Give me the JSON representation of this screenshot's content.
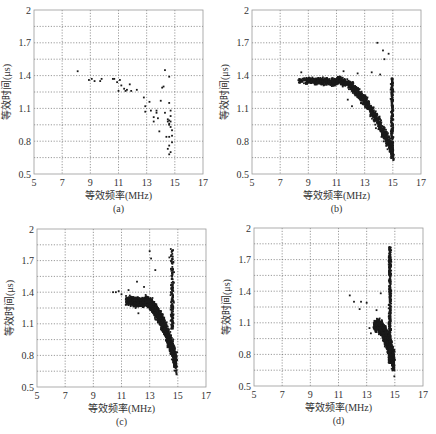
{
  "figure": {
    "panel_count": 4,
    "point_color": "#1a1a1a",
    "grid_color": "#555555",
    "frame_color": "#9a9a9a"
  },
  "axes": {
    "xlabel": "等效频率(MHz)",
    "ylabel": "等效时间(μs)",
    "xticks": [
      "5",
      "7",
      "9",
      "11",
      "13",
      "15",
      "17"
    ],
    "yticks": [
      "0.5",
      "0.8",
      "1.1",
      "1.4",
      "1.7",
      "2"
    ],
    "xlim": [
      5,
      17
    ],
    "ylim": [
      0.5,
      2.0
    ],
    "x_grid": [
      5,
      7,
      9,
      11,
      13,
      15,
      17
    ],
    "y_grid": [
      0.5,
      0.65,
      0.8,
      0.95,
      1.1,
      1.25,
      1.4,
      1.55,
      1.7,
      1.85,
      2.0
    ]
  },
  "chart_data": [
    {
      "type": "scatter",
      "panel": "(a)",
      "title": "",
      "xlabel": "等效频率(MHz)",
      "ylabel": "等效时间(μs)",
      "xlim": [
        5,
        17
      ],
      "ylim": [
        0.5,
        2.0
      ],
      "grid": true,
      "legend": null,
      "box": {
        "left": 34,
        "top": 10,
        "right": 203,
        "bottom": 174
      },
      "points": [
        [
          8.1,
          1.44
        ],
        [
          8.9,
          1.36
        ],
        [
          9.1,
          1.37
        ],
        [
          9.3,
          1.35
        ],
        [
          9.7,
          1.35
        ],
        [
          9.8,
          1.37
        ],
        [
          10.6,
          1.37
        ],
        [
          10.7,
          1.37
        ],
        [
          10.9,
          1.34
        ],
        [
          11.0,
          1.26
        ],
        [
          11.1,
          1.36
        ],
        [
          11.2,
          1.31
        ],
        [
          11.4,
          1.28
        ],
        [
          11.5,
          1.26
        ],
        [
          11.6,
          1.27
        ],
        [
          11.8,
          1.32
        ],
        [
          11.9,
          1.26
        ],
        [
          12.3,
          1.27
        ],
        [
          12.8,
          1.2
        ],
        [
          12.9,
          1.12
        ],
        [
          12.9,
          1.07
        ],
        [
          13.2,
          1.16
        ],
        [
          13.3,
          1.08
        ],
        [
          13.5,
          1.02
        ],
        [
          13.5,
          0.98
        ],
        [
          13.7,
          1.08
        ],
        [
          13.7,
          1.06
        ],
        [
          13.8,
          1.01
        ],
        [
          13.9,
          0.89
        ],
        [
          14.0,
          1.17
        ],
        [
          14.1,
          1.29
        ],
        [
          14.2,
          1.3
        ],
        [
          14.3,
          1.45
        ],
        [
          14.3,
          1.06
        ],
        [
          14.4,
          0.84
        ],
        [
          14.5,
          0.98
        ],
        [
          14.5,
          0.73
        ],
        [
          14.6,
          1.39
        ],
        [
          14.6,
          1.15
        ],
        [
          14.6,
          0.99
        ],
        [
          14.6,
          0.96
        ],
        [
          14.7,
          1.08
        ],
        [
          14.7,
          1.03
        ],
        [
          14.7,
          0.93
        ],
        [
          14.6,
          0.84
        ],
        [
          14.6,
          0.76
        ],
        [
          14.7,
          0.7
        ],
        [
          14.8,
          0.9
        ],
        [
          14.8,
          0.79
        ],
        [
          14.6,
          0.68
        ],
        [
          14.5,
          1.0
        ],
        [
          14.7,
          0.98
        ],
        [
          14.6,
          0.95
        ],
        [
          14.8,
          0.85
        ]
      ]
    },
    {
      "type": "scatter",
      "panel": "(b)",
      "title": "",
      "xlabel": "等效频率(MHz)",
      "ylabel": "等效时间(μs)",
      "xlim": [
        5,
        17
      ],
      "ylim": [
        0.5,
        2.0
      ],
      "grid": true,
      "legend": null,
      "box": {
        "left": 252,
        "top": 10,
        "right": 421,
        "bottom": 174
      },
      "description": "Dense cloud (~1500 pts): plateau at ~1.35 µs from 8.3–11.5 MHz, bending down to ~0.65 µs at ~15 MHz; vertical column at ~15 MHz from 0.65–1.4; sparse outliers up to 1.7.",
      "generated": {
        "seed": 11,
        "curve": {
          "count": 1300,
          "x_start": 8.3,
          "x_end": 15.05,
          "plateau_y": 1.36,
          "drop_start": 11.0,
          "end_y": 0.68,
          "spread": 0.045
        },
        "column": {
          "count": 260,
          "x_center": 14.95,
          "x_spread": 0.12,
          "y_min": 0.65,
          "y_max": 1.38
        },
        "outliers": [
          [
            13.9,
            1.7
          ],
          [
            14.3,
            1.63
          ],
          [
            14.7,
            1.6
          ],
          [
            14.4,
            1.55
          ],
          [
            11.5,
            1.44
          ],
          [
            13.5,
            1.43
          ],
          [
            12.5,
            1.42
          ],
          [
            14.1,
            1.41
          ],
          [
            8.5,
            1.43
          ],
          [
            11.8,
            1.18
          ],
          [
            12.1,
            1.12
          ],
          [
            13.2,
            1.2
          ]
        ]
      }
    },
    {
      "type": "scatter",
      "panel": "(c)",
      "title": "",
      "xlabel": "等效频率(MHz)",
      "ylabel": "等效时间(μs)",
      "xlim": [
        5,
        17
      ],
      "ylim": [
        0.5,
        2.0
      ],
      "grid": true,
      "legend": null,
      "box": {
        "left": 37,
        "top": 229,
        "right": 206,
        "bottom": 387
      },
      "description": "Very dense cloud (~2500 pts): starts ~10.5 MHz at 1.4 µs, dense band 12.5–15 MHz sloping down to ~0.7 µs at 14.8 MHz; vertical spike at ~14.6 MHz up to 1.8.",
      "generated": {
        "seed": 23,
        "curve": {
          "count": 2200,
          "x_start": 11.3,
          "x_end": 14.9,
          "plateau_y": 1.32,
          "drop_start": 12.6,
          "end_y": 0.72,
          "spread": 0.06
        },
        "column": {
          "count": 160,
          "x_center": 14.6,
          "x_spread": 0.15,
          "y_min": 1.05,
          "y_max": 1.8
        },
        "outliers": [
          [
            10.4,
            1.4
          ],
          [
            10.6,
            1.4
          ],
          [
            10.8,
            1.41
          ],
          [
            11.0,
            1.38
          ],
          [
            11.5,
            1.42
          ],
          [
            12.1,
            1.5
          ],
          [
            12.6,
            1.45
          ],
          [
            13.0,
            1.79
          ],
          [
            13.1,
            1.72
          ],
          [
            13.4,
            1.61
          ],
          [
            14.4,
            1.73
          ],
          [
            14.5,
            1.81
          ],
          [
            12.2,
            1.2
          ],
          [
            12.0,
            1.25
          ]
        ]
      }
    },
    {
      "type": "scatter",
      "panel": "(d)",
      "title": "",
      "xlabel": "等效频率(MHz)",
      "ylabel": "等效时间(μs)",
      "xlim": [
        5,
        17
      ],
      "ylim": [
        0.5,
        2.0
      ],
      "grid": true,
      "legend": null,
      "box": {
        "left": 254,
        "top": 228,
        "right": 423,
        "bottom": 386
      },
      "description": "Dense narrow cloud (~1800 pts): cluster 13.5–15 MHz, 0.7–1.15 µs; tall column at ~14.7 MHz up to 1.8 µs; few outliers 11.8–13 MHz near 1.2–1.35.",
      "generated": {
        "seed": 37,
        "curve": {
          "count": 1300,
          "x_start": 13.5,
          "x_end": 14.95,
          "plateau_y": 1.08,
          "drop_start": 13.7,
          "end_y": 0.72,
          "spread": 0.07
        },
        "column": {
          "count": 420,
          "x_center": 14.65,
          "x_spread": 0.13,
          "y_min": 0.72,
          "y_max": 1.82
        },
        "outliers": [
          [
            11.8,
            1.36
          ],
          [
            12.1,
            1.3
          ],
          [
            12.6,
            1.3
          ],
          [
            12.5,
            1.23
          ],
          [
            13.0,
            1.29
          ],
          [
            13.2,
            1.05
          ],
          [
            13.3,
            1.0
          ],
          [
            13.7,
            1.22
          ],
          [
            14.0,
            1.38
          ]
        ]
      }
    }
  ]
}
